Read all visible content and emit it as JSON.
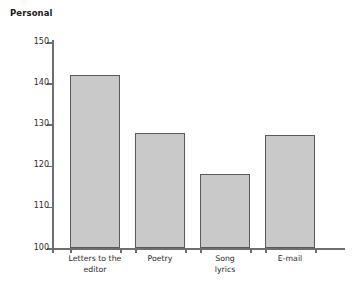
{
  "chart_data": {
    "type": "bar",
    "title": "Personal",
    "xlabel": "",
    "ylabel": "",
    "categories": [
      "Letters to the\neditor",
      "Poetry",
      "Song\nlyrics",
      "E-mail"
    ],
    "values": [
      142,
      128,
      118,
      127.5
    ],
    "ylim": [
      100,
      150
    ],
    "yticks": [
      100,
      110,
      120,
      130,
      140,
      150
    ],
    "ytick_labels": [
      "100",
      "110",
      "120",
      "130",
      "140",
      "150"
    ],
    "grid": false,
    "legend": null,
    "bar_fill_color": "#c9c9c9",
    "bar_border_color": "#5a5a5a",
    "axis_color": "#6e6e6e",
    "text_color": "#2b2b2b"
  }
}
